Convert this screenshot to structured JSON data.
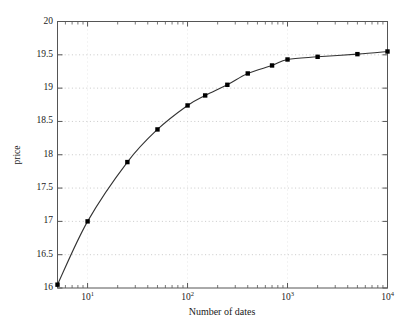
{
  "figure": {
    "background_color": "#ffffff",
    "axis_color": "#555555",
    "grid_color": "#bbbbbb",
    "line_color": "#333333",
    "marker_color": "#000000"
  },
  "chart_data": {
    "type": "line",
    "title": "",
    "xlabel": "Number of dates",
    "ylabel": "price",
    "xscale": "log",
    "yscale": "linear",
    "xlim": [
      5,
      10000
    ],
    "ylim": [
      16,
      20
    ],
    "grid": true,
    "legend": null,
    "marker": "square",
    "xticks": [
      10,
      100,
      1000,
      10000
    ],
    "xtick_labels": [
      "10",
      "10",
      "10",
      "10"
    ],
    "xtick_exponents": [
      "1",
      "2",
      "3",
      "4"
    ],
    "yticks": [
      16,
      16.5,
      17,
      17.5,
      18,
      18.5,
      19,
      19.5,
      20
    ],
    "ytick_labels": [
      "16",
      "16.5",
      "17",
      "17.5",
      "18",
      "18.5",
      "19",
      "19.5",
      "20"
    ],
    "x": [
      5,
      10,
      25,
      50,
      100,
      150,
      250,
      400,
      700,
      1000,
      2000,
      5000,
      10000
    ],
    "y": [
      16.05,
      17.0,
      17.89,
      18.38,
      18.74,
      18.89,
      19.05,
      19.22,
      19.34,
      19.43,
      19.47,
      19.51,
      19.55
    ]
  }
}
